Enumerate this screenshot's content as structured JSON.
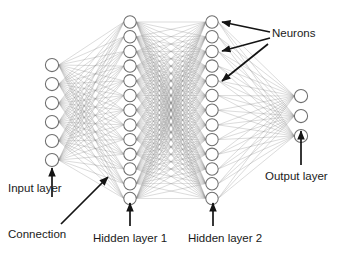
{
  "diagram": {
    "type": "neural-network-diagram",
    "background_color": "#ffffff",
    "neuron_fill": "#ffffff",
    "neuron_stroke": "#6e6e6e",
    "connection_color": "#8c8c8c",
    "annotation_color": "#141414",
    "layers": [
      {
        "id": "input",
        "label": "Input layer",
        "neuron_count": 6,
        "x": 52,
        "y_start": 65,
        "y_step": 19,
        "radius": 6.6
      },
      {
        "id": "hidden1",
        "label": "Hidden layer 1",
        "neuron_count": 13,
        "x": 130,
        "y_start": 22,
        "y_step": 14.7,
        "radius": 6.2
      },
      {
        "id": "hidden2",
        "label": "Hidden layer 2",
        "neuron_count": 13,
        "x": 212,
        "y_start": 22,
        "y_step": 14.7,
        "radius": 6.2
      },
      {
        "id": "output",
        "label": "Output layer",
        "neuron_count": 3,
        "x": 301,
        "y_start": 96,
        "y_step": 20,
        "radius": 6.6
      }
    ],
    "labels": {
      "input_layer": "Input layer",
      "connection": "Connection",
      "hidden_layer_1": "Hidden layer 1",
      "hidden_layer_2": "Hidden layer 2",
      "output_layer": "Output layer",
      "neurons": "Neurons"
    },
    "annotations": [
      {
        "name": "input-layer-annotation",
        "text": "Input layer",
        "text_x": 8,
        "text_y": 182,
        "arrow": {
          "x1": 52,
          "y1": 197,
          "x2": 52,
          "y2": 168
        }
      },
      {
        "name": "connection-annotation",
        "text": "Connection",
        "text_x": 8,
        "text_y": 228,
        "arrow": {
          "x1": 61,
          "y1": 224,
          "x2": 108,
          "y2": 177
        }
      },
      {
        "name": "hidden-layer-1-annotation",
        "text": "Hidden layer 1",
        "text_x": 93,
        "text_y": 232,
        "arrow": {
          "x1": 130,
          "y1": 226,
          "x2": 130,
          "y2": 203
        }
      },
      {
        "name": "hidden-layer-2-annotation",
        "text": "Hidden layer 2",
        "text_x": 188,
        "text_y": 232,
        "arrow": {
          "x1": 213,
          "y1": 226,
          "x2": 213,
          "y2": 203
        }
      },
      {
        "name": "output-layer-annotation",
        "text": "Output layer",
        "text_x": 265,
        "text_y": 170,
        "arrow": {
          "x1": 301,
          "y1": 165,
          "x2": 301,
          "y2": 131
        }
      },
      {
        "name": "neurons-annotation",
        "text": "Neurons",
        "text_x": 272,
        "text_y": 27,
        "arrows": [
          {
            "x1": 270,
            "y1": 32,
            "x2": 222,
            "y2": 22
          },
          {
            "x1": 270,
            "y1": 38,
            "x2": 222,
            "y2": 51
          },
          {
            "x1": 268,
            "y1": 44,
            "x2": 222,
            "y2": 81
          }
        ]
      }
    ],
    "connection_sets": [
      {
        "from": "input",
        "to": "hidden1",
        "fully_connected": true
      },
      {
        "from": "hidden1",
        "to": "hidden2",
        "fully_connected": true
      },
      {
        "from": "hidden2",
        "to": "output",
        "fully_connected": true
      }
    ]
  }
}
